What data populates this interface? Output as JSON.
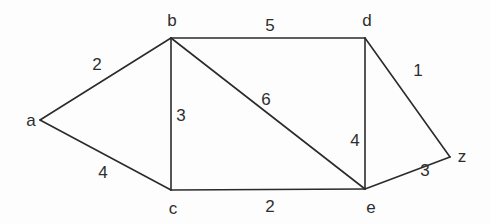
{
  "graph": {
    "type": "weighted-undirected-graph",
    "vertices": [
      {
        "id": "a",
        "label": "a"
      },
      {
        "id": "b",
        "label": "b"
      },
      {
        "id": "c",
        "label": "c"
      },
      {
        "id": "d",
        "label": "d"
      },
      {
        "id": "e",
        "label": "e"
      },
      {
        "id": "z",
        "label": "z"
      }
    ],
    "edges": [
      {
        "from": "a",
        "to": "b",
        "weight": "2"
      },
      {
        "from": "a",
        "to": "c",
        "weight": "4"
      },
      {
        "from": "b",
        "to": "c",
        "weight": "3"
      },
      {
        "from": "b",
        "to": "d",
        "weight": "5"
      },
      {
        "from": "b",
        "to": "e",
        "weight": "6"
      },
      {
        "from": "c",
        "to": "e",
        "weight": "2"
      },
      {
        "from": "d",
        "to": "e",
        "weight": "4"
      },
      {
        "from": "d",
        "to": "z",
        "weight": "1"
      },
      {
        "from": "e",
        "to": "z",
        "weight": "3"
      }
    ]
  }
}
